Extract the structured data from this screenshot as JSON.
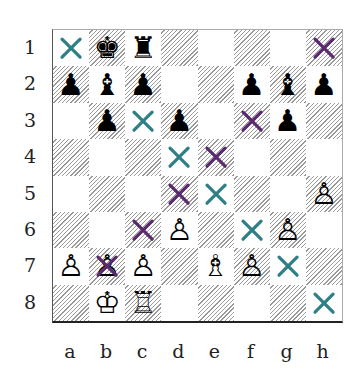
{
  "board": {
    "ranks": [
      "1",
      "2",
      "3",
      "4",
      "5",
      "6",
      "7",
      "8"
    ],
    "files": [
      "a",
      "b",
      "c",
      "d",
      "e",
      "f",
      "g",
      "h"
    ],
    "colors": {
      "teal_mark": "#2e7f86",
      "purple_mark": "#5b2a6e"
    },
    "squares": [
      [
        {
          "piece": "",
          "mark": "teal"
        },
        {
          "piece": "♚",
          "side": "black",
          "mark": ""
        },
        {
          "piece": "♜",
          "side": "black",
          "mark": ""
        },
        {
          "piece": "",
          "mark": ""
        },
        {
          "piece": "",
          "mark": ""
        },
        {
          "piece": "",
          "mark": ""
        },
        {
          "piece": "",
          "mark": ""
        },
        {
          "piece": "",
          "mark": "purple"
        }
      ],
      [
        {
          "piece": "♟",
          "side": "black",
          "mark": ""
        },
        {
          "piece": "♝",
          "side": "black",
          "mark": ""
        },
        {
          "piece": "♟",
          "side": "black",
          "mark": ""
        },
        {
          "piece": "",
          "mark": ""
        },
        {
          "piece": "",
          "mark": ""
        },
        {
          "piece": "♟",
          "side": "black",
          "mark": ""
        },
        {
          "piece": "♝",
          "side": "black",
          "mark": ""
        },
        {
          "piece": "♟",
          "side": "black",
          "mark": ""
        }
      ],
      [
        {
          "piece": "",
          "mark": ""
        },
        {
          "piece": "♟",
          "side": "black",
          "mark": ""
        },
        {
          "piece": "",
          "mark": "teal"
        },
        {
          "piece": "♟",
          "side": "black",
          "mark": ""
        },
        {
          "piece": "",
          "mark": ""
        },
        {
          "piece": "",
          "mark": "purple"
        },
        {
          "piece": "♟",
          "side": "black",
          "mark": ""
        },
        {
          "piece": "",
          "mark": ""
        }
      ],
      [
        {
          "piece": "",
          "mark": ""
        },
        {
          "piece": "",
          "mark": ""
        },
        {
          "piece": "",
          "mark": ""
        },
        {
          "piece": "",
          "mark": "teal"
        },
        {
          "piece": "",
          "mark": "purple"
        },
        {
          "piece": "",
          "mark": ""
        },
        {
          "piece": "",
          "mark": ""
        },
        {
          "piece": "",
          "mark": ""
        }
      ],
      [
        {
          "piece": "",
          "mark": ""
        },
        {
          "piece": "",
          "mark": ""
        },
        {
          "piece": "",
          "mark": ""
        },
        {
          "piece": "",
          "mark": "purple"
        },
        {
          "piece": "",
          "mark": "teal"
        },
        {
          "piece": "",
          "mark": ""
        },
        {
          "piece": "",
          "mark": ""
        },
        {
          "piece": "♙",
          "side": "white",
          "mark": ""
        }
      ],
      [
        {
          "piece": "",
          "mark": ""
        },
        {
          "piece": "",
          "mark": ""
        },
        {
          "piece": "",
          "mark": "purple"
        },
        {
          "piece": "♙",
          "side": "white",
          "mark": ""
        },
        {
          "piece": "",
          "mark": ""
        },
        {
          "piece": "",
          "mark": "teal"
        },
        {
          "piece": "♙",
          "side": "white",
          "mark": ""
        },
        {
          "piece": "",
          "mark": ""
        }
      ],
      [
        {
          "piece": "♙",
          "side": "white",
          "mark": ""
        },
        {
          "piece": "♙",
          "side": "white",
          "mark": "purple"
        },
        {
          "piece": "♙",
          "side": "white",
          "mark": ""
        },
        {
          "piece": "",
          "mark": ""
        },
        {
          "piece": "♗",
          "side": "white",
          "mark": ""
        },
        {
          "piece": "♙",
          "side": "white",
          "mark": ""
        },
        {
          "piece": "",
          "mark": "teal"
        },
        {
          "piece": "",
          "mark": ""
        }
      ],
      [
        {
          "piece": "",
          "mark": ""
        },
        {
          "piece": "♔",
          "side": "white",
          "mark": ""
        },
        {
          "piece": "♖",
          "side": "white",
          "mark": ""
        },
        {
          "piece": "",
          "mark": ""
        },
        {
          "piece": "",
          "mark": ""
        },
        {
          "piece": "",
          "mark": ""
        },
        {
          "piece": "",
          "mark": ""
        },
        {
          "piece": "",
          "mark": "teal"
        }
      ]
    ]
  }
}
